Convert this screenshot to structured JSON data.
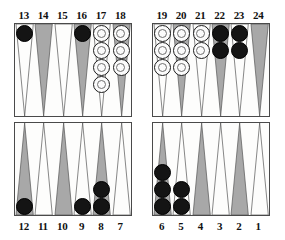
{
  "board": {
    "title": "Backgammon board diagram",
    "colors": {
      "point_light": "#fdfdfc",
      "point_dark": "#a8a8a8",
      "point_outline": "#555555",
      "checker_black": "#141414",
      "checker_white": "#fbfbfb",
      "board_border": "#4a4a4a",
      "background": "#ffffff",
      "label_text": "#111111"
    },
    "quadrants": {
      "top_left_label": "13-18",
      "top_right_label": "19-24",
      "bottom_left_label": "12-7",
      "bottom_right_label": "6-1"
    },
    "top_labels": [
      "13",
      "14",
      "15",
      "16",
      "17",
      "18",
      "19",
      "20",
      "21",
      "22",
      "23",
      "24"
    ],
    "bottom_labels": [
      "12",
      "11",
      "10",
      "9",
      "8",
      "7",
      "6",
      "5",
      "4",
      "3",
      "2",
      "1"
    ],
    "points": [
      {
        "number": "13",
        "half": "tl",
        "slot": 0,
        "shade": "light",
        "side": "top",
        "checkers": 1,
        "color": "black"
      },
      {
        "number": "14",
        "half": "tl",
        "slot": 1,
        "shade": "dark",
        "side": "top",
        "checkers": 0,
        "color": "none"
      },
      {
        "number": "15",
        "half": "tl",
        "slot": 2,
        "shade": "light",
        "side": "top",
        "checkers": 0,
        "color": "none"
      },
      {
        "number": "16",
        "half": "tl",
        "slot": 3,
        "shade": "dark",
        "side": "top",
        "checkers": 1,
        "color": "black"
      },
      {
        "number": "17",
        "half": "tl",
        "slot": 4,
        "shade": "light",
        "side": "top",
        "checkers": 4,
        "color": "white"
      },
      {
        "number": "18",
        "half": "tl",
        "slot": 5,
        "shade": "dark",
        "side": "top",
        "checkers": 3,
        "color": "white"
      },
      {
        "number": "19",
        "half": "tr",
        "slot": 0,
        "shade": "light",
        "side": "top",
        "checkers": 3,
        "color": "white"
      },
      {
        "number": "20",
        "half": "tr",
        "slot": 1,
        "shade": "dark",
        "side": "top",
        "checkers": 3,
        "color": "white"
      },
      {
        "number": "21",
        "half": "tr",
        "slot": 2,
        "shade": "light",
        "side": "top",
        "checkers": 2,
        "color": "white"
      },
      {
        "number": "22",
        "half": "tr",
        "slot": 3,
        "shade": "dark",
        "side": "top",
        "checkers": 2,
        "color": "black"
      },
      {
        "number": "23",
        "half": "tr",
        "slot": 4,
        "shade": "light",
        "side": "top",
        "checkers": 2,
        "color": "black"
      },
      {
        "number": "24",
        "half": "tr",
        "slot": 5,
        "shade": "dark",
        "side": "top",
        "checkers": 0,
        "color": "none"
      },
      {
        "number": "12",
        "half": "bl",
        "slot": 0,
        "shade": "dark",
        "side": "bottom",
        "checkers": 1,
        "color": "black"
      },
      {
        "number": "11",
        "half": "bl",
        "slot": 1,
        "shade": "light",
        "side": "bottom",
        "checkers": 0,
        "color": "none"
      },
      {
        "number": "10",
        "half": "bl",
        "slot": 2,
        "shade": "dark",
        "side": "bottom",
        "checkers": 0,
        "color": "none"
      },
      {
        "number": "9",
        "half": "bl",
        "slot": 3,
        "shade": "light",
        "side": "bottom",
        "checkers": 1,
        "color": "black"
      },
      {
        "number": "8",
        "half": "bl",
        "slot": 4,
        "shade": "dark",
        "side": "bottom",
        "checkers": 2,
        "color": "black"
      },
      {
        "number": "7",
        "half": "bl",
        "slot": 5,
        "shade": "light",
        "side": "bottom",
        "checkers": 0,
        "color": "none"
      },
      {
        "number": "6",
        "half": "br",
        "slot": 0,
        "shade": "dark",
        "side": "bottom",
        "checkers": 3,
        "color": "black"
      },
      {
        "number": "5",
        "half": "br",
        "slot": 1,
        "shade": "light",
        "side": "bottom",
        "checkers": 2,
        "color": "black"
      },
      {
        "number": "4",
        "half": "br",
        "slot": 2,
        "shade": "dark",
        "side": "bottom",
        "checkers": 0,
        "color": "none"
      },
      {
        "number": "3",
        "half": "br",
        "slot": 3,
        "shade": "light",
        "side": "bottom",
        "checkers": 0,
        "color": "none"
      },
      {
        "number": "2",
        "half": "br",
        "slot": 4,
        "shade": "dark",
        "side": "bottom",
        "checkers": 0,
        "color": "none"
      },
      {
        "number": "1",
        "half": "br",
        "slot": 5,
        "shade": "light",
        "side": "bottom",
        "checkers": 0,
        "color": "none"
      }
    ],
    "totals": {
      "black_on_board": "12",
      "white_on_board": "15"
    }
  }
}
